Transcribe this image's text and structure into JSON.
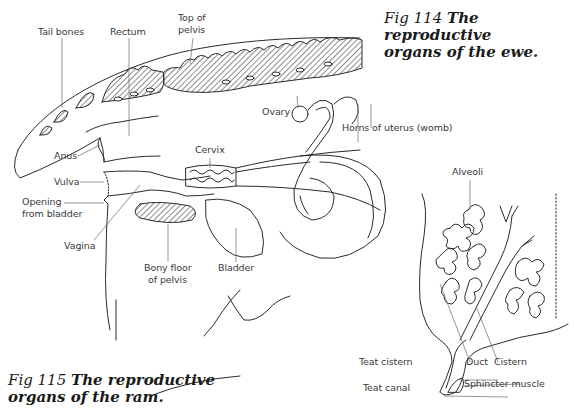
{
  "figures": [
    {
      "id": "fig114",
      "fig_number": "Fig 114",
      "title_line1": "The reproductive",
      "title_line2": "organs of the ewe.",
      "labels": {
        "tail_bones": "Tail bones",
        "rectum": "Rectum",
        "top_of_pelvis_1": "Top of",
        "top_of_pelvis_2": "pelvis",
        "ovary": "Ovary",
        "horns_of_uterus": "Horns of uterus (womb)",
        "anus": "Anus",
        "cervix": "Cervix",
        "vulva": "Vulva",
        "opening_from_bladder_1": "Opening",
        "opening_from_bladder_2": "from bladder",
        "vagina": "Vagina",
        "bony_floor_1": "Bony floor",
        "bony_floor_2": "of pelvis",
        "bladder": "Bladder"
      }
    },
    {
      "id": "udder",
      "labels": {
        "alveoli": "Alveoli",
        "teat_cistern": "Teat cistern",
        "duct": "Duct",
        "cistern": "Cistern",
        "teat_canal": "Teat canal",
        "sphincter_muscle": "Sphincter muscle"
      }
    },
    {
      "id": "fig115",
      "fig_number": "Fig 115",
      "title_line1": "The reproductive",
      "title_line2": "organs of the ram."
    }
  ],
  "style": {
    "line_color": "#2b2b2b",
    "label_color": "#3a3a3a",
    "leader_color": "#6a6a6a"
  }
}
